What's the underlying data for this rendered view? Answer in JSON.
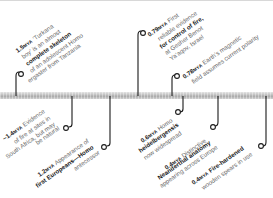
{
  "timeline": {
    "colors": {
      "bar": "#b5b5b5",
      "connector": "#1a1a1a",
      "text": "#666666",
      "emphasis": "#1a1a1a"
    },
    "events": [
      {
        "id": "turkana-boy",
        "position": "above",
        "date": "1.5",
        "unit": "MYA",
        "lines": [
          "‘Turkana",
          "boy’ is an almost",
          "complete skeleton",
          "of an adolescent Homo",
          "ergaster from Tanzania"
        ],
        "emphasis": [
          "complete skeleton",
          "Homo",
          "ergaster"
        ]
      },
      {
        "id": "fire-evidence-africa",
        "position": "below",
        "date": "~1.4",
        "unit": "MYA",
        "lines": [
          "Evidence",
          "of fire at sites in",
          "South Africa, but may",
          "be natural"
        ],
        "emphasis": [
          "fire"
        ]
      },
      {
        "id": "first-europeans",
        "position": "below",
        "date": "1.2",
        "unit": "MYA",
        "lines": [
          "Appearance of",
          "first Europeans—Homo",
          "antecessor"
        ],
        "emphasis": [
          "first Europeans"
        ]
      },
      {
        "id": "control-of-fire",
        "position": "above",
        "date": "0.79",
        "unit": "MYA",
        "lines": [
          "First",
          "reliable evidence",
          "for control of fire,",
          "at Gesher Benot",
          "Ya’aqov, Israel"
        ],
        "emphasis": [
          "control of fire"
        ]
      },
      {
        "id": "magnetic-field",
        "position": "above",
        "date": "0.78",
        "unit": "MYA",
        "lines": [
          "Earth’s magnetic",
          "field assumes current polarity"
        ],
        "emphasis": [
          "magnetic",
          "field"
        ]
      },
      {
        "id": "homo-heidelbergensis",
        "position": "below",
        "date": "0.6",
        "unit": "MYA",
        "lines": [
          "Homo",
          "heidelbergensis",
          "now widespread"
        ],
        "emphasis": [
          "heidelbergensis"
        ]
      },
      {
        "id": "neanderthal-anatomy",
        "position": "below",
        "date": "0.4",
        "unit": "MYA",
        "lines": [
          "Distinctive",
          "Neanderthal anatomy",
          "appearing across Europe"
        ],
        "emphasis": [
          "Neanderthal anatomy"
        ]
      },
      {
        "id": "wooden-spears",
        "position": "below",
        "date": "0.4",
        "unit": "MYA",
        "lines": [
          "Fire-hardened",
          "wooden spears in use"
        ],
        "emphasis": [
          "Fire-hardened"
        ]
      }
    ]
  }
}
